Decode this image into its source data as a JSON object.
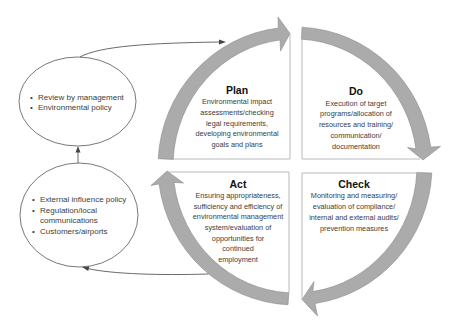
{
  "diagram": {
    "bullet": "•",
    "quadrants": {
      "plan": {
        "title": "Plan",
        "lines": [
          "Environmental impact",
          "assessments/checking",
          "legal requirements,",
          "developing environmental",
          "goals and plans"
        ]
      },
      "do": {
        "title": "Do",
        "lines": [
          "Execution of target",
          "programs/allocation of",
          "resources and training/",
          "communication/",
          "documentation"
        ]
      },
      "check": {
        "title": "Check",
        "lines": [
          "Monitoring and measuring/",
          "evaluation of compliance/",
          "internal and external audits/",
          "prevention measures"
        ]
      },
      "act": {
        "title": "Act",
        "lines": [
          "Ensuring appropriateness,",
          "sufficiency and efficiency of",
          "environmental management",
          "system/evaluation of",
          "opportunities for",
          "continued",
          "employment"
        ]
      }
    },
    "inputs": {
      "top_ellipse": {
        "items": [
          {
            "lines": [
              "Review by management"
            ]
          },
          {
            "lines": [
              "Environmental policy"
            ]
          }
        ]
      },
      "bottom_ellipse": {
        "items": [
          {
            "lines": [
              "External influence policy"
            ]
          },
          {
            "lines": [
              "Regulation/local",
              "communications"
            ]
          },
          {
            "lines": [
              "Customers/airports"
            ]
          }
        ]
      }
    }
  },
  "colors": {
    "arrow_fill": "#ababab",
    "arrow_stroke": "#8c8c8c",
    "box_line": "#a8a8a8",
    "connector": "#444444",
    "title": "#111111",
    "body_text": "#3c3c3c"
  }
}
